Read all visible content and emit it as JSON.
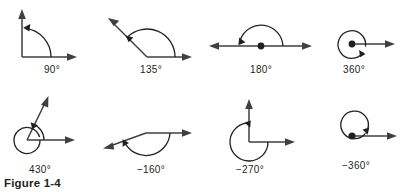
{
  "figure": {
    "caption": "Figure 1-4",
    "background_color": "#ffffff",
    "line_color": "#3f3f44",
    "arc_color": "#231f20",
    "text_color": "#231f20"
  },
  "panels": [
    {
      "id": "angle-90",
      "label": "90°",
      "measure_degrees": 90,
      "direction": "counterclockwise",
      "initial_ray": "east",
      "terminal_ray": "north",
      "vertex_dot": false,
      "full_turns": 0
    },
    {
      "id": "angle-135",
      "label": "135°",
      "measure_degrees": 135,
      "direction": "counterclockwise",
      "initial_ray": "east",
      "terminal_ray": "northwest",
      "vertex_dot": false,
      "full_turns": 0
    },
    {
      "id": "angle-180",
      "label": "180°",
      "measure_degrees": 180,
      "direction": "counterclockwise",
      "initial_ray": "east",
      "terminal_ray": "west",
      "vertex_dot": true,
      "full_turns": 0
    },
    {
      "id": "angle-360",
      "label": "360°",
      "measure_degrees": 360,
      "direction": "counterclockwise",
      "initial_ray": "east",
      "terminal_ray": "east",
      "vertex_dot": true,
      "full_turns": 1
    },
    {
      "id": "angle-430",
      "label": "430°",
      "measure_degrees": 430,
      "direction": "counterclockwise",
      "initial_ray": "east",
      "terminal_ray": "north-northeast",
      "vertex_dot": false,
      "full_turns": 1
    },
    {
      "id": "angle-neg160",
      "label": "−160°",
      "measure_degrees": -160,
      "direction": "clockwise",
      "initial_ray": "east",
      "terminal_ray": "southwest",
      "vertex_dot": false,
      "full_turns": 0
    },
    {
      "id": "angle-neg270",
      "label": "−270°",
      "measure_degrees": -270,
      "direction": "clockwise",
      "initial_ray": "east",
      "terminal_ray": "north",
      "vertex_dot": false,
      "full_turns": 0
    },
    {
      "id": "angle-neg360",
      "label": "−360°",
      "measure_degrees": -360,
      "direction": "clockwise",
      "initial_ray": "east",
      "terminal_ray": "east",
      "vertex_dot": true,
      "full_turns": 1
    }
  ]
}
